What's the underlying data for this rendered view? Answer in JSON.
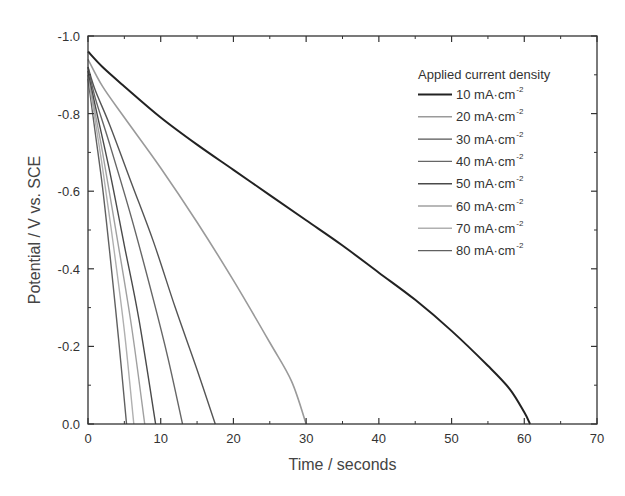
{
  "chart_data": {
    "type": "line",
    "title": "",
    "xlabel": "Time / seconds",
    "ylabel": "Potential / V vs. SCE",
    "xlim": [
      0,
      70
    ],
    "ylim": [
      0.0,
      -1.0
    ],
    "y_axis_inverted": true,
    "xticks": [
      0,
      10,
      20,
      30,
      40,
      50,
      60,
      70
    ],
    "xtick_labels": [
      "0",
      "10",
      "20",
      "30",
      "40",
      "50",
      "60",
      "70"
    ],
    "yticks": [
      -1.0,
      -0.8,
      -0.6,
      -0.4,
      -0.2,
      0.0
    ],
    "ytick_labels": [
      "-1.0",
      "-0.8",
      "-0.6",
      "-0.4",
      "-0.2",
      "0.0"
    ],
    "grid": false,
    "legend_title": "Applied current density",
    "legend_position": "upper right",
    "series": [
      {
        "name": "10 mA·cm-2",
        "color": "#222222",
        "width": 2.0,
        "x": [
          0,
          2,
          5,
          10,
          15,
          20,
          25,
          30,
          35,
          40,
          45,
          50,
          55,
          58,
          60,
          60.8
        ],
        "y": [
          -0.96,
          -0.92,
          -0.87,
          -0.79,
          -0.72,
          -0.655,
          -0.59,
          -0.525,
          -0.46,
          -0.39,
          -0.32,
          -0.24,
          -0.15,
          -0.09,
          -0.03,
          0.0
        ]
      },
      {
        "name": "20 mA·cm-2",
        "color": "#9a9a9a",
        "width": 1.6,
        "x": [
          0,
          2,
          5,
          10,
          15,
          20,
          25,
          28,
          30
        ],
        "y": [
          -0.94,
          -0.87,
          -0.79,
          -0.66,
          -0.52,
          -0.37,
          -0.21,
          -0.11,
          0.0
        ]
      },
      {
        "name": "30 mA·cm-2",
        "color": "#555555",
        "width": 1.4,
        "x": [
          0,
          1,
          3,
          6,
          9,
          12,
          15,
          17.5
        ],
        "y": [
          -0.92,
          -0.86,
          -0.77,
          -0.62,
          -0.47,
          -0.3,
          -0.14,
          0.0
        ]
      },
      {
        "name": "40 mA·cm-2",
        "color": "#666666",
        "width": 1.4,
        "x": [
          0,
          1,
          3,
          6,
          9,
          11,
          13.0
        ],
        "y": [
          -0.92,
          -0.84,
          -0.72,
          -0.53,
          -0.32,
          -0.17,
          0.0
        ]
      },
      {
        "name": "50 mA·cm-2",
        "color": "#4a4a4a",
        "width": 1.4,
        "x": [
          0,
          1,
          3,
          5,
          7,
          9.3
        ],
        "y": [
          -0.91,
          -0.82,
          -0.65,
          -0.46,
          -0.27,
          0.0
        ]
      },
      {
        "name": "60 mA·cm-2",
        "color": "#a0a0a0",
        "width": 1.4,
        "x": [
          0,
          1,
          2,
          4,
          6,
          7.8
        ],
        "y": [
          -0.9,
          -0.8,
          -0.7,
          -0.48,
          -0.25,
          0.0
        ]
      },
      {
        "name": "70 mA·cm-2",
        "color": "#b0b0b0",
        "width": 1.4,
        "x": [
          0,
          1,
          2,
          3.5,
          5,
          6.3
        ],
        "y": [
          -0.9,
          -0.78,
          -0.66,
          -0.46,
          -0.24,
          0.0
        ]
      },
      {
        "name": "80 mA·cm-2",
        "color": "#606060",
        "width": 1.4,
        "x": [
          0,
          1,
          2,
          3,
          4.2,
          5.3
        ],
        "y": [
          -0.89,
          -0.75,
          -0.61,
          -0.44,
          -0.22,
          0.0
        ]
      }
    ]
  },
  "legend": {
    "title": "Applied current density",
    "items": [
      {
        "value": "10",
        "unit": " mA·cm",
        "sup": "-2",
        "color": "#222222",
        "width": 2.0
      },
      {
        "value": "20",
        "unit": " mA·cm",
        "sup": "-2",
        "color": "#9a9a9a",
        "width": 1.6
      },
      {
        "value": "30",
        "unit": " mA·cm",
        "sup": "-2",
        "color": "#555555",
        "width": 1.4
      },
      {
        "value": "40",
        "unit": " mA·cm",
        "sup": "-2",
        "color": "#666666",
        "width": 1.4
      },
      {
        "value": "50",
        "unit": " mA·cm",
        "sup": "-2",
        "color": "#4a4a4a",
        "width": 1.4
      },
      {
        "value": "60",
        "unit": " mA·cm",
        "sup": "-2",
        "color": "#a0a0a0",
        "width": 1.4
      },
      {
        "value": "70",
        "unit": " mA·cm",
        "sup": "-2",
        "color": "#b0b0b0",
        "width": 1.4
      },
      {
        "value": "80",
        "unit": " mA·cm",
        "sup": "-2",
        "color": "#606060",
        "width": 1.4
      }
    ]
  },
  "layout": {
    "plot_left": 88,
    "plot_top": 36,
    "plot_right": 597,
    "plot_bottom": 424,
    "axis_color": "#333333"
  }
}
